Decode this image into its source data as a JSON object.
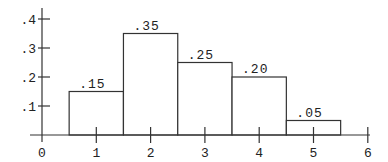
{
  "chart_data": {
    "type": "bar",
    "title": "",
    "xlabel": "",
    "ylabel": "",
    "bars": [
      {
        "x_left": 0.5,
        "x_right": 1.5,
        "center": 1,
        "value": 0.15,
        "label": ".15"
      },
      {
        "x_left": 1.5,
        "x_right": 2.5,
        "center": 2,
        "value": 0.35,
        "label": ".35"
      },
      {
        "x_left": 2.5,
        "x_right": 3.5,
        "center": 3,
        "value": 0.25,
        "label": ".25"
      },
      {
        "x_left": 3.5,
        "x_right": 4.5,
        "center": 4,
        "value": 0.2,
        "label": ".20"
      },
      {
        "x_left": 4.5,
        "x_right": 5.5,
        "center": 5,
        "value": 0.05,
        "label": ".05"
      }
    ],
    "categories": [
      "1",
      "2",
      "3",
      "4",
      "5"
    ],
    "values": [
      0.15,
      0.35,
      0.25,
      0.2,
      0.05
    ],
    "xticks": [
      {
        "value": 0,
        "label": "0"
      },
      {
        "value": 1,
        "label": "1"
      },
      {
        "value": 2,
        "label": "2"
      },
      {
        "value": 3,
        "label": "3"
      },
      {
        "value": 4,
        "label": "4"
      },
      {
        "value": 5,
        "label": "5"
      },
      {
        "value": 6,
        "label": "6"
      }
    ],
    "yticks": [
      {
        "value": 0.1,
        "label": ".1"
      },
      {
        "value": 0.2,
        "label": ".2"
      },
      {
        "value": 0.3,
        "label": ".3"
      },
      {
        "value": 0.4,
        "label": ".4"
      }
    ],
    "xlim": [
      0,
      6
    ],
    "ylim": [
      0,
      0.44
    ],
    "grid": false,
    "legend": null,
    "colors": {
      "stroke": "#333333",
      "fill": "#ffffff",
      "text": "#222222"
    }
  }
}
